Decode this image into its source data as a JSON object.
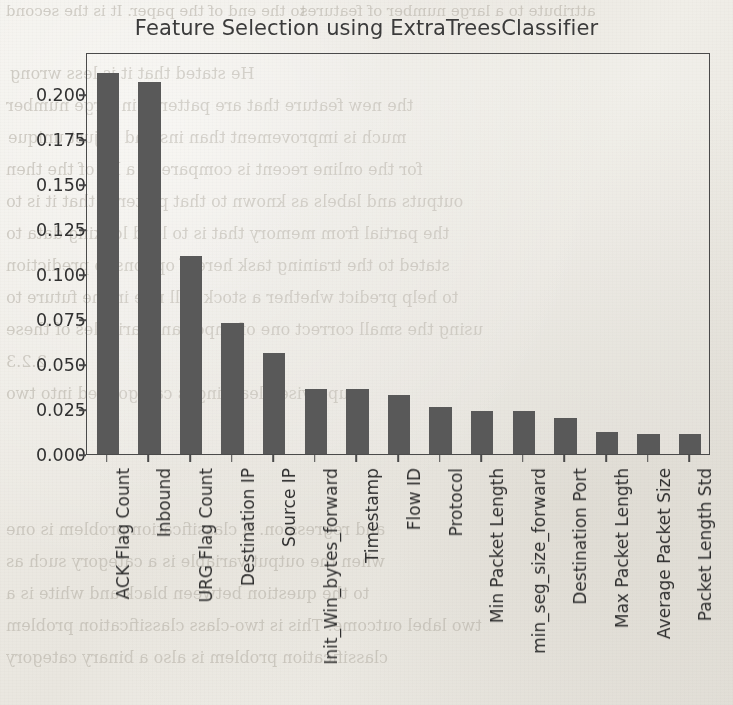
{
  "chart_data": {
    "type": "bar",
    "title": "Feature Selection using ExtraTreesClassifier",
    "xlabel": "",
    "ylabel": "",
    "ylim": [
      0.0,
      0.2235
    ],
    "grid": false,
    "legend": null,
    "yticks": [
      "0.000",
      "0.025",
      "0.050",
      "0.075",
      "0.100",
      "0.125",
      "0.150",
      "0.175",
      "0.200"
    ],
    "ytick_values": [
      0.0,
      0.025,
      0.05,
      0.075,
      0.1,
      0.125,
      0.15,
      0.175,
      0.2
    ],
    "categories": [
      "ACK Flag Count",
      "Inbound",
      "URG Flag Count",
      "Destination IP",
      "Source IP",
      "Init_Win_bytes_forward",
      "Timestamp",
      "Flow ID",
      "Protocol",
      "Min Packet Length",
      "min_seg_size_forward",
      "Destination Port",
      "Max Packet Length",
      "Average Packet Size",
      "Packet Length Std"
    ],
    "values": [
      0.212,
      0.207,
      0.11,
      0.073,
      0.056,
      0.036,
      0.036,
      0.033,
      0.026,
      0.024,
      0.024,
      0.02,
      0.012,
      0.011,
      0.011
    ],
    "bar_color": "#595959"
  },
  "background": {
    "paper_color": "#ece9e3",
    "bleed_lines": [
      {
        "text": "to the end of the paper. It is the second",
        "x": 6,
        "y": 2,
        "size": 15
      },
      {
        "text": "attribute to a large number of features",
        "x": 300,
        "y": 2,
        "size": 15
      },
      {
        "text": "He stated that it is less wrong",
        "x": 10,
        "y": 64,
        "size": 16
      },
      {
        "text": "the new feature that are patterns in large number",
        "x": 6,
        "y": 96,
        "size": 16
      },
      {
        "text": "much is improvement than instead of just unique",
        "x": 8,
        "y": 128,
        "size": 16
      },
      {
        "text": "for the online recent is compare to a lot of the then",
        "x": 6,
        "y": 160,
        "size": 16
      },
      {
        "text": "outputs and labels as known to that patterns that it is to",
        "x": 6,
        "y": 192,
        "size": 16
      },
      {
        "text": "the partial from memory that is to lead looking data to",
        "x": 6,
        "y": 224,
        "size": 16
      },
      {
        "text": "stated to the training task here if options to prediction",
        "x": 6,
        "y": 256,
        "size": 16
      },
      {
        "text": "to help predict whether a stock will rise in the future to",
        "x": 6,
        "y": 288,
        "size": 16
      },
      {
        "text": "using the small correct one of important variables of these",
        "x": 6,
        "y": 320,
        "size": 16
      },
      {
        "text": "2.2.3",
        "x": 6,
        "y": 352,
        "size": 16
      },
      {
        "text": "supervised learning is categorized into two",
        "x": 6,
        "y": 384,
        "size": 16
      },
      {
        "text": "and regression. A classification problem is one",
        "x": 6,
        "y": 520,
        "size": 16
      },
      {
        "text": "when the output variable is a category such as",
        "x": 6,
        "y": 552,
        "size": 16
      },
      {
        "text": "to the question between black and white is a",
        "x": 6,
        "y": 584,
        "size": 16
      },
      {
        "text": "two label outcome. This is two-class classification problem",
        "x": 6,
        "y": 616,
        "size": 16
      },
      {
        "text": "classification problem is also a binary category",
        "x": 6,
        "y": 648,
        "size": 16
      }
    ]
  }
}
